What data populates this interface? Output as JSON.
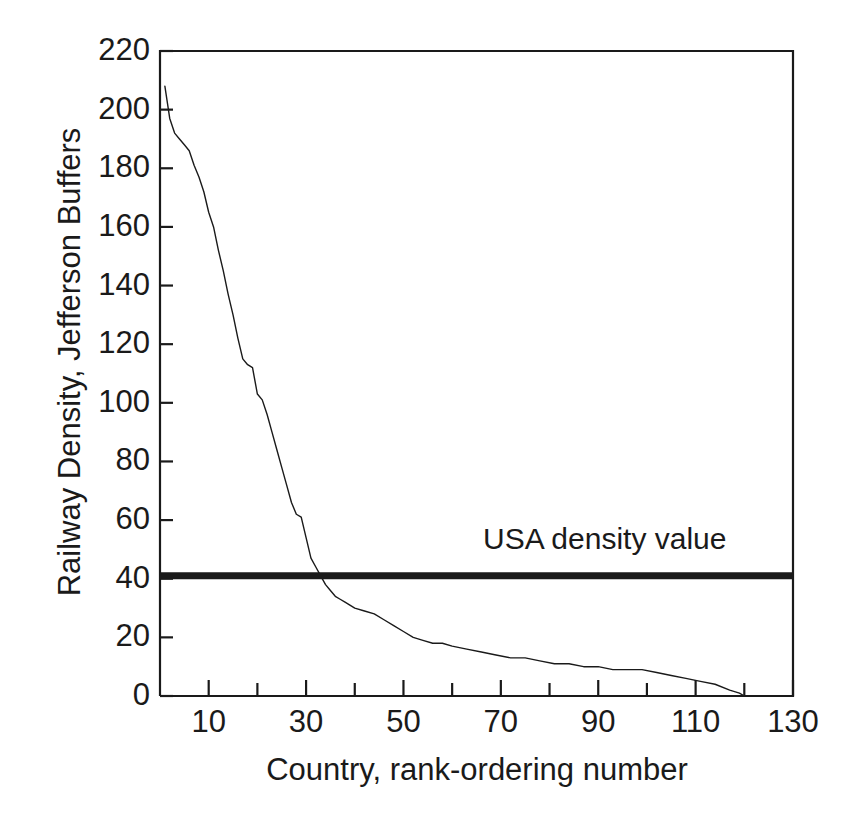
{
  "chart_data": {
    "type": "line",
    "title": "",
    "subtitle": "",
    "xlabel": "Country, rank-ordering number",
    "ylabel": "Railway Density, Jefferson Buffers",
    "xlim": [
      0,
      130
    ],
    "ylim": [
      0,
      220
    ],
    "grid": false,
    "legend_position": "none",
    "x_major_ticks": [
      10,
      30,
      50,
      70,
      90,
      110,
      130
    ],
    "x_minor_ticks": [
      20,
      40,
      60,
      80,
      100,
      120
    ],
    "x_tick_labels": [
      "10",
      "30",
      "50",
      "70",
      "90",
      "110",
      "130"
    ],
    "y_ticks": [
      0,
      20,
      40,
      60,
      80,
      100,
      120,
      140,
      160,
      180,
      200,
      220
    ],
    "y_tick_labels": [
      "0",
      "20",
      "40",
      "60",
      "80",
      "100",
      "120",
      "140",
      "160",
      "180",
      "200",
      "220"
    ],
    "series": [
      {
        "name": "Railway density by country rank",
        "type": "line",
        "color": "#1a1a1a",
        "linewidth": 1.4,
        "x": [
          1,
          2,
          3,
          4,
          5,
          6,
          7,
          8,
          9,
          10,
          11,
          12,
          13,
          14,
          15,
          16,
          17,
          18,
          19,
          20,
          21,
          22,
          23,
          24,
          25,
          26,
          27,
          28,
          29,
          30,
          31,
          32,
          33,
          34,
          35,
          36,
          37,
          38,
          39,
          40,
          42,
          44,
          46,
          48,
          50,
          52,
          54,
          56,
          58,
          60,
          63,
          66,
          69,
          72,
          75,
          78,
          81,
          84,
          87,
          90,
          93,
          96,
          99,
          102,
          105,
          108,
          111,
          114,
          117,
          119,
          120,
          124,
          130
        ],
        "y": [
          208,
          197,
          192,
          190,
          188,
          186,
          181,
          177,
          172,
          165,
          160,
          152,
          145,
          137,
          130,
          122,
          115,
          113,
          112,
          103,
          101,
          96,
          90,
          84,
          78,
          72,
          66,
          62,
          61,
          54,
          47,
          44,
          41,
          38,
          36,
          34,
          33,
          32,
          31,
          30,
          29,
          28,
          26,
          24,
          22,
          20,
          19,
          18,
          18,
          17,
          16,
          15,
          14,
          13,
          13,
          12,
          11,
          11,
          10,
          10,
          9,
          9,
          9,
          8,
          7,
          6,
          5,
          4,
          2,
          1,
          0,
          0,
          0
        ]
      }
    ],
    "reference_lines": [
      {
        "name": "usa-density-line",
        "label": "USA density value",
        "orientation": "horizontal",
        "value": 41,
        "color": "#1a1a1a",
        "linewidth": 7
      }
    ],
    "annotations": [
      {
        "name": "usa-density-label",
        "text": "USA density value",
        "x": 68,
        "y": 52
      }
    ]
  },
  "axes": {
    "y_title": "Railway Density, Jefferson Buffers",
    "x_title": "Country, rank-ordering number"
  },
  "annotation": {
    "usa_label": "USA density value"
  }
}
